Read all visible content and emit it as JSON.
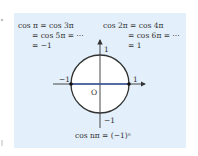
{
  "left_equation": {
    "line1": "cos π = cos 3π",
    "line2": "= cos 5π = ···",
    "line3": "= −1"
  },
  "right_equation": {
    "line1": "cos 2π = cos 4π",
    "line2": "= cos 6π = ···",
    "line3": "= 1"
  },
  "axis_labels": {
    "top": "1",
    "bottom": "−1",
    "left": "−1",
    "right": "1",
    "origin": "O"
  },
  "caption": "cos nπ = (−1)ⁿ",
  "colors": {
    "panel": "#e3effa",
    "axis_highlight": "#3a5aa0",
    "circle": "#333333"
  }
}
